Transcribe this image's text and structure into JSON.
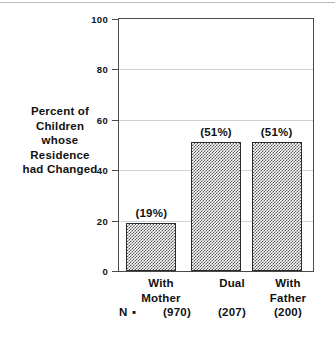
{
  "chart_data": {
    "type": "bar",
    "title": "",
    "xlabel": "",
    "ylabel": "Percent of Children whose Residence had Changed",
    "ylabel_lines": [
      "Percent of",
      "Children",
      "whose",
      "Residence",
      "had Changed"
    ],
    "categories": [
      "With Mother",
      "Dual",
      "With Father"
    ],
    "category_lines": [
      [
        "With",
        "Mother"
      ],
      [
        "Dual"
      ],
      [
        "With",
        "Father"
      ]
    ],
    "values": [
      19,
      51,
      51
    ],
    "value_labels": [
      "(19%)",
      "(51%)",
      "(51%)"
    ],
    "ylim": [
      0,
      100
    ],
    "yticks": [
      0,
      20,
      40,
      60,
      80,
      100
    ],
    "ytick_labels": [
      "0",
      "20",
      "40",
      "60",
      "80",
      "100"
    ],
    "grid": true,
    "legend": "none",
    "n_prefix": "N ▪",
    "n_labels": [
      "(970)",
      "(207)",
      "(200)"
    ],
    "n_values": [
      970,
      207,
      200
    ],
    "colors": {
      "bar_fill": "#5a5a5a",
      "bar_edge": "#2b2b2b",
      "axis": "#4a4a4a",
      "grid": "#d2d2d2",
      "text": "#111111",
      "background": "#ffffff"
    }
  }
}
